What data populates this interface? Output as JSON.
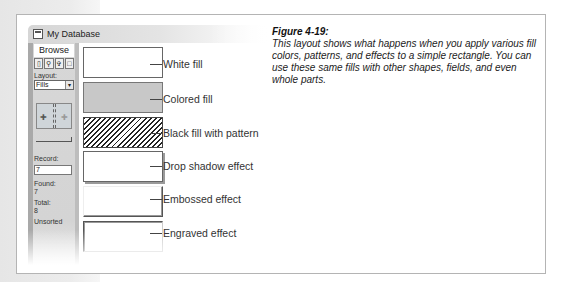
{
  "window": {
    "title": "My Database"
  },
  "status_area": {
    "mode": "Browse",
    "mode_tools": [
      "browse-tool",
      "find-tool",
      "layout-tool",
      "preview-tool"
    ],
    "layout_label": "Layout:",
    "layout_value": "Fills",
    "record_label": "Record:",
    "record_value": "7",
    "found_label": "Found:",
    "found_value": "7",
    "total_label": "Total:",
    "total_value": "8",
    "sort_status": "Unsorted"
  },
  "callouts": [
    {
      "label": "White fill"
    },
    {
      "label": "Colored fill"
    },
    {
      "label": "Black fill with pattern"
    },
    {
      "label": "Drop shadow effect"
    },
    {
      "label": "Embossed effect"
    },
    {
      "label": "Engraved effect"
    }
  ],
  "caption": {
    "title": "Figure 4-19:",
    "body": "This layout shows what happens when you apply various fill colors, patterns, and effects to a simple rectangle. You can use these same fills with other shapes, fields, and even whole parts."
  },
  "colors": {
    "colored_fill": "#c8c8c8",
    "status_area_bg": "#d4d4d4",
    "frame_border": "#b4b4b4"
  }
}
